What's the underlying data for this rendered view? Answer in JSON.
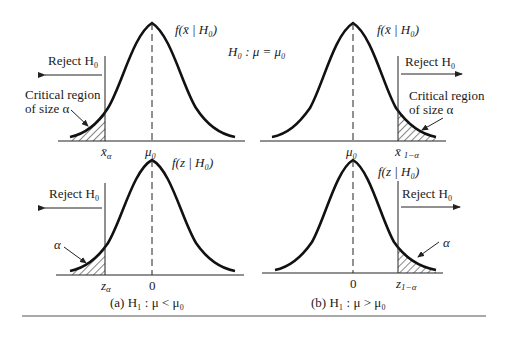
{
  "hypothesis_null": "H₀ : μ = μ₀",
  "panels": {
    "top_left": {
      "density_label": "f(x̄ | H₀)",
      "reject_label": "Reject H₀",
      "critical_line1": "Critical region",
      "critical_line2": "of size α",
      "center_tick": "μ₀",
      "cutoff_tick": "x̄",
      "cutoff_sub": "α",
      "tail": "left"
    },
    "top_right": {
      "density_label": "f(x̄ | H₀)",
      "reject_label": "Reject H₀",
      "critical_line1": "Critical region",
      "critical_line2": "of size α",
      "center_tick": "μ₀",
      "cutoff_tick": "x̄",
      "cutoff_sub": "1−α",
      "tail": "right"
    },
    "bottom_left": {
      "density_label": "f(z | H₀)",
      "reject_label": "Reject H₀",
      "alpha_label": "α",
      "center_tick": "0",
      "cutoff_tick": "z",
      "cutoff_sub": "α",
      "tail": "left"
    },
    "bottom_right": {
      "density_label": "f(z | H₀)",
      "reject_label": "Reject H₀",
      "alpha_label": "α",
      "center_tick": "0",
      "cutoff_tick": "z",
      "cutoff_sub": "1−α",
      "tail": "right"
    }
  },
  "captions": {
    "a": "(a)  H₁ : μ < μ₀",
    "b": "(b)  H₁ : μ > μ₀"
  }
}
